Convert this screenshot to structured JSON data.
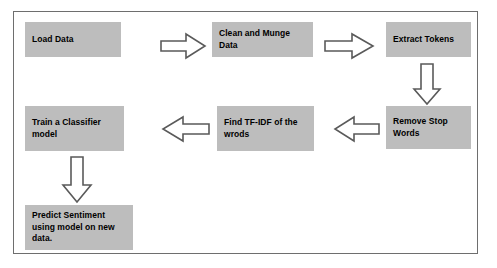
{
  "diagram": {
    "background_color": "#ffffff",
    "frame_border_color": "#6e6e6e",
    "node_fill_color": "#bdbdbd",
    "node_text_color": "#000000",
    "arrow_fill_color": "#ffffff",
    "arrow_stroke_color": "#5a5a5a",
    "nodes": [
      {
        "id": "load-data",
        "label": "Load Data"
      },
      {
        "id": "clean-and-munge-data",
        "label": "Clean and Munge Data"
      },
      {
        "id": "extract-tokens",
        "label": "Extract Tokens"
      },
      {
        "id": "remove-stop-words",
        "label": "Remove Stop Words"
      },
      {
        "id": "find-tf-idf",
        "label": "Find TF-IDF of the wrods"
      },
      {
        "id": "train-classifier",
        "label": "Train a Classifier model"
      },
      {
        "id": "predict-sentiment",
        "label": "Predict Sentiment using model on new data."
      }
    ],
    "arrows": [
      {
        "id": "load-to-clean",
        "direction": "right"
      },
      {
        "id": "clean-to-extract",
        "direction": "right"
      },
      {
        "id": "extract-to-remove",
        "direction": "down"
      },
      {
        "id": "remove-to-tfidf",
        "direction": "left"
      },
      {
        "id": "tfidf-to-train",
        "direction": "left"
      },
      {
        "id": "train-to-predict",
        "direction": "down"
      }
    ]
  }
}
